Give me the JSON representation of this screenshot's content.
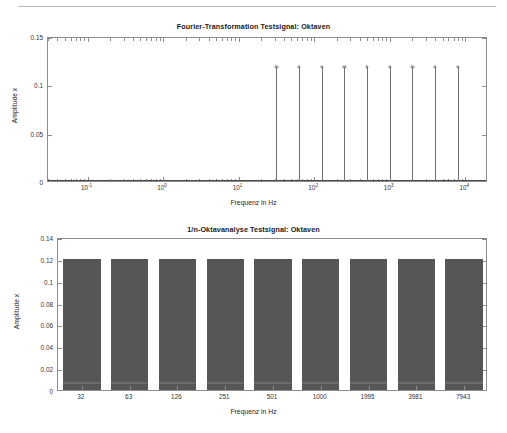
{
  "figure_top": {
    "title": "Fourier-Transformation Testsignal: Oktaven",
    "xlabel": "Frequenz in Hz",
    "ylabel": "Amplitude x"
  },
  "figure_bottom": {
    "title": "1/n-Oktavanalyse Testsignal: Oktaven",
    "xlabel": "Frequenz in Hz",
    "ylabel": "Amplitude x"
  },
  "chart_data": [
    {
      "type": "line",
      "plot_style": "stem",
      "title": "Fourier-Transformation Testsignal: Oktaven",
      "xlabel": "Frequenz in Hz",
      "ylabel": "Amplitude x",
      "xscale": "log",
      "xlim": [
        0.03,
        20000
      ],
      "ylim": [
        0,
        0.15
      ],
      "yticks": [
        0,
        0.05,
        0.1,
        0.15
      ],
      "ytick_labels": [
        "0",
        "0.05",
        "0.1",
        "0.15"
      ],
      "xticks": [
        0.1,
        1,
        10,
        100,
        1000,
        10000
      ],
      "xtick_labels": [
        "10-1",
        "100",
        "101",
        "102",
        "103",
        "104"
      ],
      "xtick_mantissa": [
        "10",
        "10",
        "10",
        "10",
        "10",
        "10"
      ],
      "xtick_exponent": [
        "-1",
        "0",
        "1",
        "2",
        "3",
        "4"
      ],
      "grid": false,
      "legend": null,
      "x": [
        31.6,
        63.1,
        125.9,
        251.2,
        501.2,
        1000.0,
        1995.3,
        3981.1,
        7943.3
      ],
      "values": [
        0.12,
        0.12,
        0.12,
        0.12,
        0.12,
        0.12,
        0.12,
        0.12,
        0.12
      ],
      "marker": "circle",
      "baseline_x": [
        0.04,
        0.05,
        0.063,
        0.079,
        0.1,
        0.126,
        0.158,
        0.2,
        0.251,
        0.316,
        0.398,
        0.501,
        0.63,
        0.72,
        0.79,
        0.87,
        0.93,
        1.0,
        1.1,
        1.2,
        1.3,
        1.45,
        1.6,
        1.8,
        2.0,
        2.3,
        2.6,
        3.0,
        3.4,
        4.0
      ],
      "baseline_y": 0
    },
    {
      "type": "bar",
      "title": "1/n-Oktavanalyse Testsignal: Oktaven",
      "xlabel": "Frequenz in Hz",
      "ylabel": "Amplitude x",
      "categories": [
        "32",
        "63",
        "126",
        "251",
        "501",
        "1000",
        "1995",
        "3981",
        "7943"
      ],
      "values": [
        0.12,
        0.12,
        0.12,
        0.12,
        0.12,
        0.12,
        0.12,
        0.12,
        0.12
      ],
      "ylim": [
        0,
        0.14
      ],
      "yticks": [
        0,
        0.02,
        0.04,
        0.06,
        0.08,
        0.1,
        0.12,
        0.14
      ],
      "ytick_labels": [
        "0",
        "0.02",
        "0.04",
        "0.06",
        "0.08",
        "0.1",
        "0.12",
        "0.14"
      ],
      "grid": false,
      "legend": null,
      "bar_color": "#565656"
    }
  ]
}
